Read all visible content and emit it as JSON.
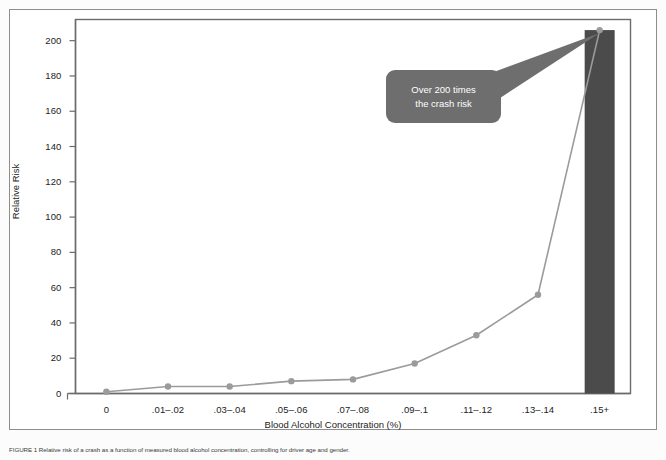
{
  "figure": {
    "background_color": "#fcfcfc",
    "panel_border_color": "#8d8d8d"
  },
  "callout": {
    "line1": "Over 200 times",
    "line2": "the crash risk",
    "fill_color": "#6e6e6e",
    "text_color": "#ffffff"
  },
  "caption": {
    "text": "FIGURE 1 Relative risk of a crash as a function of measured blood alcohol concentration, controlling for driver age and gender."
  },
  "chart_data": {
    "type": "line",
    "title": "",
    "subtitle": "",
    "xlabel": "Blood Alcohol Concentration (%)",
    "ylabel": "Relative Risk",
    "categories": [
      "0",
      ".01–.02",
      ".03–.04",
      ".05–.06",
      ".07–.08",
      ".09–.1",
      ".11–.12",
      ".13–.14",
      ".15+"
    ],
    "values": [
      1,
      4,
      4,
      7,
      8,
      17,
      33,
      56,
      206
    ],
    "ylim": [
      0,
      212
    ],
    "yticks": [
      0,
      20,
      40,
      60,
      80,
      100,
      120,
      140,
      160,
      180,
      200
    ],
    "ytick_labels": [
      "0",
      "20",
      "40",
      "60",
      "80",
      "100",
      "120",
      "140",
      "160",
      "180",
      "200"
    ],
    "grid": false,
    "legend": "none",
    "line_color": "#9b9b9b",
    "marker_color": "#9b9b9b",
    "bar_highlight": {
      "category": ".15+",
      "value": 206,
      "color": "#4b4b4b"
    },
    "annotations": [
      {
        "text": "Over 200 times the crash risk",
        "points_to_category": ".15+",
        "points_to_value": 206
      }
    ]
  }
}
